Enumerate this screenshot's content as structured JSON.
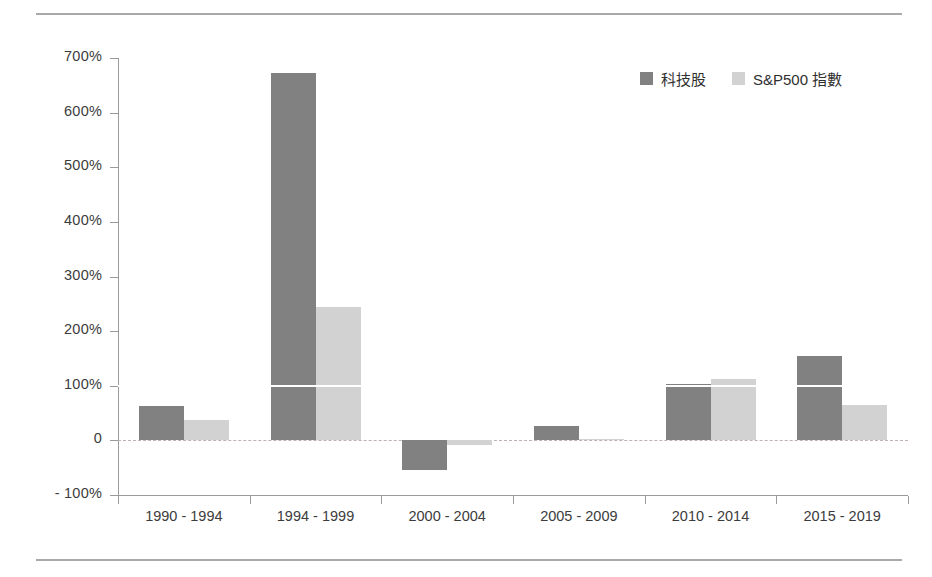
{
  "chart_data": {
    "type": "bar",
    "title": "",
    "subtitle": "",
    "xlabel": "",
    "ylabel": "",
    "categories": [
      "1990 - 1994",
      "1994 - 1999",
      "2000 - 2004",
      "2005 - 2009",
      "2010 - 2014",
      "2015 - 2019"
    ],
    "series": [
      {
        "name": "科技股",
        "color": "#818181",
        "values": [
          63,
          673,
          -55,
          26,
          103,
          155
        ]
      },
      {
        "name": "S&P500 指數",
        "color": "#d2d2d2",
        "values": [
          37,
          245,
          -9,
          3,
          113,
          64
        ]
      }
    ],
    "ylim": [
      -100,
      700
    ],
    "yticks": [
      700,
      600,
      500,
      400,
      300,
      200,
      100,
      0,
      -100
    ],
    "ytick_labels": [
      "700%",
      "600%",
      "500%",
      "400%",
      "300%",
      "200%",
      "100%",
      "0",
      "- 100%"
    ],
    "unit": "%",
    "grid": "zero-line-dashed-plus-white-100-gridline",
    "legend_position": "top-right",
    "zero_line_color": "#c0b0b0",
    "axis_color": "#9a9a9a"
  },
  "legend": {
    "items": [
      {
        "label": "科技股",
        "color": "#818181"
      },
      {
        "label": "S&P500 指數",
        "color": "#d2d2d2"
      }
    ]
  }
}
